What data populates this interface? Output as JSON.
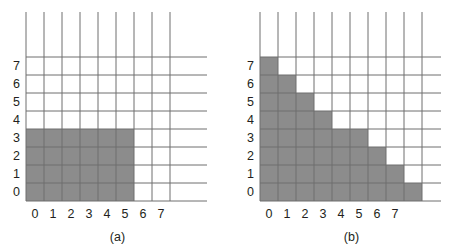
{
  "figure": {
    "background_color": "#ffffff",
    "fill_color": "#8c8c8c",
    "grid_color": "#6f6f6f",
    "text_color": "#231f20",
    "cell_size": 18
  },
  "chart_data": [
    {
      "type": "heatmap",
      "title": "(a)",
      "caption": "(a)",
      "xlabel": "",
      "ylabel": "",
      "x": [
        0,
        1,
        2,
        3,
        4,
        5,
        6,
        7
      ],
      "y": [
        0,
        1,
        2,
        3,
        4,
        5,
        6,
        7
      ],
      "xticklabels": [
        "0",
        "1",
        "2",
        "3",
        "4",
        "5",
        "6",
        "7"
      ],
      "yticklabels": [
        "0",
        "1",
        "2",
        "3",
        "4",
        "5",
        "6",
        "7"
      ],
      "xlim": [
        0,
        9
      ],
      "ylim": [
        0,
        9
      ],
      "grid": true,
      "legend": "none",
      "description": "Filled rectangular region of pixels covering columns 0 through 5 and rows 0 through 3.",
      "filled_cells_per_row": [
        {
          "row": 0,
          "col_start": 0,
          "col_end": 5,
          "count": 6
        },
        {
          "row": 1,
          "col_start": 0,
          "col_end": 5,
          "count": 6
        },
        {
          "row": 2,
          "col_start": 0,
          "col_end": 5,
          "count": 6
        },
        {
          "row": 3,
          "col_start": 0,
          "col_end": 5,
          "count": 6
        },
        {
          "row": 4,
          "col_start": null,
          "col_end": null,
          "count": 0
        },
        {
          "row": 5,
          "col_start": null,
          "col_end": null,
          "count": 0
        },
        {
          "row": 6,
          "col_start": null,
          "col_end": null,
          "count": 0
        },
        {
          "row": 7,
          "col_start": null,
          "col_end": null,
          "count": 0
        },
        {
          "row": 8,
          "col_start": null,
          "col_end": null,
          "count": 0
        }
      ],
      "grid_lines": {
        "vertical": 9,
        "horizontal": 9
      }
    },
    {
      "type": "heatmap",
      "title": "(b)",
      "caption": "(b)",
      "xlabel": "",
      "ylabel": "",
      "x": [
        0,
        1,
        2,
        3,
        4,
        5,
        6,
        7
      ],
      "y": [
        0,
        1,
        2,
        3,
        4,
        5,
        6,
        7
      ],
      "xticklabels": [
        "0",
        "1",
        "2",
        "3",
        "4",
        "5",
        "6",
        "7"
      ],
      "yticklabels": [
        "0",
        "1",
        "2",
        "3",
        "4",
        "5",
        "6",
        "7"
      ],
      "xlim": [
        0,
        10
      ],
      "ylim": [
        0,
        9
      ],
      "grid": true,
      "legend": "none",
      "description": "Staircase (triangular) filled region descending from left to right.",
      "filled_cells_per_row": [
        {
          "row": 0,
          "col_start": 0,
          "col_end": 8,
          "count": 9
        },
        {
          "row": 1,
          "col_start": 0,
          "col_end": 7,
          "count": 8
        },
        {
          "row": 2,
          "col_start": 0,
          "col_end": 6,
          "count": 7
        },
        {
          "row": 3,
          "col_start": 0,
          "col_end": 5,
          "count": 6
        },
        {
          "row": 4,
          "col_start": 0,
          "col_end": 3,
          "count": 4
        },
        {
          "row": 5,
          "col_start": 0,
          "col_end": 2,
          "count": 3
        },
        {
          "row": 6,
          "col_start": 0,
          "col_end": 1,
          "count": 2
        },
        {
          "row": 7,
          "col_start": 0,
          "col_end": 0,
          "count": 1
        },
        {
          "row": 8,
          "col_start": null,
          "col_end": null,
          "count": 0
        }
      ],
      "grid_lines": {
        "vertical": 10,
        "horizontal": 9
      }
    }
  ]
}
